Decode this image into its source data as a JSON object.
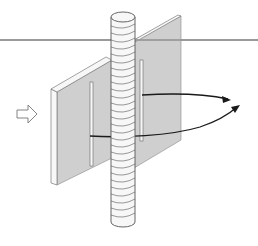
{
  "diagram": {
    "colors": {
      "background": "#ffffff",
      "plate_fill": "#cfcfcf",
      "plate_edge": "#f4f4f4",
      "outline": "#555555",
      "horizon_line": "#9a9a9a",
      "arrow": "#1a1a1a",
      "rod_fill": "#f7f7f7"
    },
    "elements": {
      "horizon_line": "horizontal-reference-line",
      "plate": "slotted-plate",
      "rod": "threaded-rod",
      "flow_arrow": "hollow-right-arrow",
      "rotation_arrows": "curved-rotation-arrows"
    }
  }
}
